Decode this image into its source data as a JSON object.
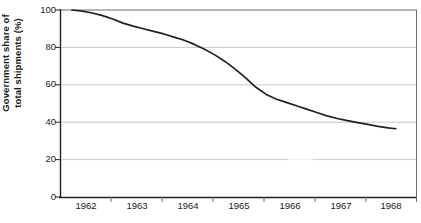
{
  "chart_data": {
    "type": "line",
    "title": "",
    "xlabel": "",
    "ylabel": "Government share of total shipments (%)",
    "ylabel_line1": "Government share of",
    "ylabel_line2": "total shipments (%)",
    "categories": [
      "1962",
      "1963",
      "1964",
      "1965",
      "1966",
      "1967",
      "1968"
    ],
    "x": [
      1962,
      1963,
      1964,
      1965,
      1966,
      1967,
      1968
    ],
    "values": [
      100,
      88,
      79,
      60,
      49,
      40,
      36.5
    ],
    "series": [
      {
        "name": "Government share of total shipments",
        "values": [
          100,
          88,
          79,
          60,
          49,
          40,
          36.5
        ],
        "color": "#231f20"
      }
    ],
    "dense_points": [
      {
        "x": 1962.0,
        "y": 100.0
      },
      {
        "x": 1962.2,
        "y": 99.4
      },
      {
        "x": 1962.4,
        "y": 98.4
      },
      {
        "x": 1962.6,
        "y": 97.0
      },
      {
        "x": 1962.8,
        "y": 95.2
      },
      {
        "x": 1963.0,
        "y": 93.0
      },
      {
        "x": 1963.2,
        "y": 91.4
      },
      {
        "x": 1963.4,
        "y": 90.0
      },
      {
        "x": 1963.6,
        "y": 88.6
      },
      {
        "x": 1963.8,
        "y": 87.2
      },
      {
        "x": 1964.0,
        "y": 85.5
      },
      {
        "x": 1964.2,
        "y": 83.8
      },
      {
        "x": 1964.4,
        "y": 81.6
      },
      {
        "x": 1964.6,
        "y": 79.0
      },
      {
        "x": 1964.8,
        "y": 76.0
      },
      {
        "x": 1965.0,
        "y": 72.5
      },
      {
        "x": 1965.2,
        "y": 68.4
      },
      {
        "x": 1965.4,
        "y": 63.8
      },
      {
        "x": 1965.6,
        "y": 58.8
      },
      {
        "x": 1965.8,
        "y": 55.0
      },
      {
        "x": 1966.0,
        "y": 52.4
      },
      {
        "x": 1966.2,
        "y": 50.6
      },
      {
        "x": 1966.4,
        "y": 48.8
      },
      {
        "x": 1966.6,
        "y": 47.0
      },
      {
        "x": 1966.8,
        "y": 45.2
      },
      {
        "x": 1967.0,
        "y": 43.4
      },
      {
        "x": 1967.2,
        "y": 42.0
      },
      {
        "x": 1967.4,
        "y": 40.8
      },
      {
        "x": 1967.6,
        "y": 39.8
      },
      {
        "x": 1967.8,
        "y": 38.8
      },
      {
        "x": 1968.0,
        "y": 37.8
      },
      {
        "x": 1968.2,
        "y": 37.0
      },
      {
        "x": 1968.35,
        "y": 36.5
      }
    ],
    "ylim": [
      0,
      100
    ],
    "y_ticks": [
      0,
      20,
      40,
      60,
      80,
      100
    ],
    "y_tick_labels": [
      "0",
      "20",
      "40",
      "60",
      "80",
      "100"
    ],
    "grid": "horizontal",
    "grid_color": "#c9c9c9",
    "axis_color": "#231f20",
    "legend": "none",
    "background": "#ffffff"
  }
}
